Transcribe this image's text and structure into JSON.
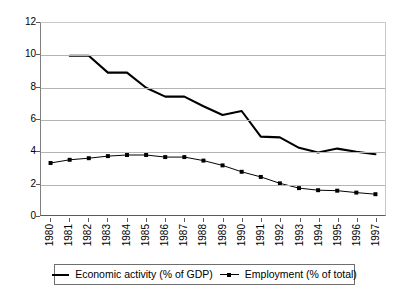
{
  "chart_data": {
    "type": "line",
    "title": "",
    "subtitle": "",
    "xlabel": "",
    "ylabel": "",
    "ylim": [
      0,
      12
    ],
    "ytick_labels": [
      "12",
      "10",
      "8",
      "6",
      "4",
      "2",
      "0"
    ],
    "ytick_values": [
      12,
      10,
      8,
      6,
      4,
      2,
      0
    ],
    "grid": true,
    "grid_axis": "y",
    "legend_position": "bottom",
    "categories": [
      "1980",
      "1981",
      "1982",
      "1983",
      "1984",
      "1985",
      "1986",
      "1987",
      "1988",
      "1989",
      "1990",
      "1991",
      "1992",
      "1993",
      "1994",
      "1995",
      "1996",
      "1997"
    ],
    "series": [
      {
        "name": "Economic activity (% of GDP)",
        "style": "thick-line",
        "marker": "none",
        "color": "#000000",
        "values": [
          null,
          9.95,
          9.95,
          8.9,
          8.9,
          7.95,
          7.4,
          7.4,
          6.8,
          6.25,
          6.5,
          4.9,
          4.85,
          4.2,
          3.9,
          4.15,
          3.95,
          3.8
        ]
      },
      {
        "name": "Employment (% of total)",
        "style": "thin-line",
        "marker": "square",
        "color": "#000000",
        "values": [
          3.25,
          3.45,
          3.55,
          3.68,
          3.75,
          3.75,
          3.62,
          3.62,
          3.4,
          3.1,
          2.7,
          2.38,
          1.98,
          1.68,
          1.55,
          1.52,
          1.4,
          1.3
        ]
      }
    ]
  },
  "legend": {
    "entries": [
      {
        "label": "Economic activity (% of GDP)",
        "marker_icon": "line-swatch-icon"
      },
      {
        "label": "Employment (% of total)",
        "marker_icon": "line-marker-swatch-icon"
      }
    ]
  }
}
